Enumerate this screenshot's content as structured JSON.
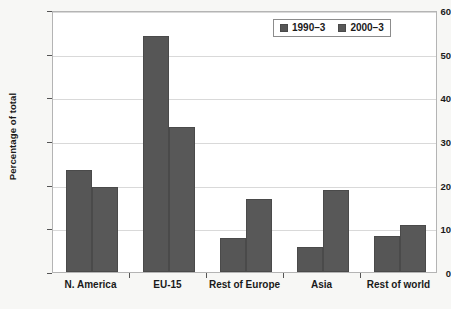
{
  "chart_data": {
    "type": "bar",
    "title": "",
    "xlabel": "",
    "ylabel": "Percentage of total",
    "categories": [
      "N. America",
      "EU-15",
      "Rest of Europe",
      "Asia",
      "Rest of world"
    ],
    "series": [
      {
        "name": "1990–3",
        "values": [
          23.3,
          54.0,
          7.8,
          5.8,
          8.3
        ]
      },
      {
        "name": "2000–3",
        "values": [
          19.4,
          33.3,
          16.8,
          18.7,
          10.8
        ]
      }
    ],
    "ylim": [
      0,
      60
    ],
    "yticks": [
      0,
      10,
      20,
      30,
      40,
      50,
      60
    ],
    "ytick_labels": [
      "0",
      "10",
      "20",
      "30",
      "40",
      "50",
      "60"
    ],
    "grid": true,
    "legend_position": "top-right",
    "colors": {
      "series1": "#565656",
      "series2": "#585858",
      "gridline": "#d9d9d9",
      "plot_border": "#b4b4b4",
      "plot_background": "#ffffff",
      "figure_background": "#f7f7f5",
      "text": "#1a1a1a"
    }
  },
  "legend": {
    "items": [
      {
        "label": "1990–3"
      },
      {
        "label": "2000–3"
      }
    ]
  }
}
